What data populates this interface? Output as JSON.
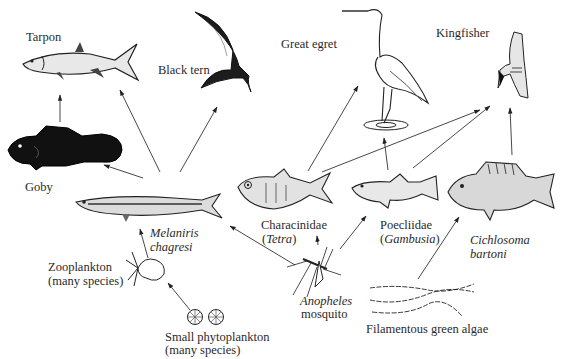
{
  "diagram": {
    "type": "food-web",
    "nodes": [
      {
        "id": "tarpon",
        "label": "Tarpon"
      },
      {
        "id": "black_tern",
        "label": "Black tern"
      },
      {
        "id": "great_egret",
        "label": "Great egret"
      },
      {
        "id": "kingfisher",
        "label": "Kingfisher"
      },
      {
        "id": "goby",
        "label": "Goby"
      },
      {
        "id": "melaniris",
        "label_line1": "Melaniris",
        "label_line2": "chagresi"
      },
      {
        "id": "characinidae",
        "label_line1": "Characinidae",
        "label_line2_open": "(",
        "label_line2_italic": "Tetra",
        "label_line2_close": ")"
      },
      {
        "id": "poeciliidae",
        "label_line1": "Poecliidae",
        "label_line2_open": "(",
        "label_line2_italic": "Gambusia",
        "label_line2_close": ")"
      },
      {
        "id": "cichlosoma",
        "label_line1": "Cichlosoma",
        "label_line2": "bartoni"
      },
      {
        "id": "zooplankton",
        "label_line1": "Zooplankton",
        "label_line2": "(many species)"
      },
      {
        "id": "anopheles",
        "label_line1": "Anopheles",
        "label_line2": "mosquito"
      },
      {
        "id": "phytoplankton",
        "label_line1": "Small phytoplankton",
        "label_line2": "(many species)"
      },
      {
        "id": "algae",
        "label": "Filamentous green algae"
      }
    ],
    "edges": [
      {
        "from": "goby",
        "to": "tarpon"
      },
      {
        "from": "melaniris",
        "to": "tarpon"
      },
      {
        "from": "melaniris",
        "to": "goby"
      },
      {
        "from": "melaniris",
        "to": "black_tern"
      },
      {
        "from": "characinidae",
        "to": "great_egret"
      },
      {
        "from": "characinidae",
        "to": "kingfisher"
      },
      {
        "from": "poeciliidae",
        "to": "great_egret"
      },
      {
        "from": "poeciliidae",
        "to": "kingfisher"
      },
      {
        "from": "cichlosoma",
        "to": "kingfisher"
      },
      {
        "from": "zooplankton",
        "to": "melaniris"
      },
      {
        "from": "phytoplankton",
        "to": "zooplankton"
      },
      {
        "from": "anopheles",
        "to": "melaniris"
      },
      {
        "from": "anopheles",
        "to": "characinidae"
      },
      {
        "from": "anopheles",
        "to": "poeciliidae"
      },
      {
        "from": "algae",
        "to": "cichlosoma"
      }
    ],
    "colors": {
      "ink": "#222222",
      "background": "#ffffff"
    }
  }
}
